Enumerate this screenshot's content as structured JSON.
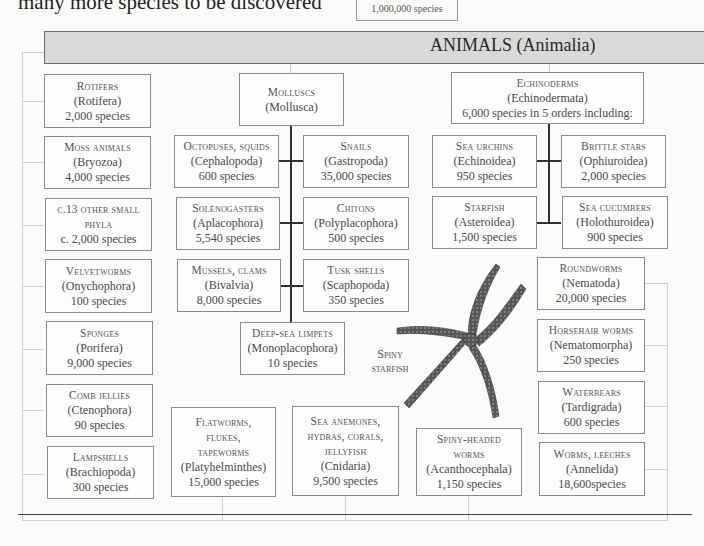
{
  "intro_text": "many more species to be discovered",
  "kingdom_summary": "1,000,000 species",
  "banner": {
    "title": "ANIMALS (Animalia)",
    "color": "#d9d9d7"
  },
  "left_column": [
    {
      "name": "Rotifers",
      "latin": "(Rotifera)",
      "count": "2,000 species"
    },
    {
      "name": "Moss animals",
      "latin": "(Bryozoa)",
      "count": "4,000 species"
    },
    {
      "name": "c.13 other small phyla",
      "latin": "",
      "count": "c. 2,000 species"
    },
    {
      "name": "Velvetworms",
      "latin": "(Onychophora)",
      "count": "100 species"
    },
    {
      "name": "Sponges",
      "latin": "(Porifera)",
      "count": "9,000 species"
    },
    {
      "name": "Comb jellies",
      "latin": "(Ctenophora)",
      "count": "90 species"
    },
    {
      "name": "Lampshells",
      "latin": "(Brachiopoda)",
      "count": "300 species"
    }
  ],
  "molluscs": {
    "parent": {
      "name": "Molluscs",
      "latin": "(Mollusca)"
    },
    "children": [
      {
        "name": "Octopuses, squids",
        "latin": "(Cephalopoda)",
        "count": "600 species"
      },
      {
        "name": "Snails",
        "latin": "(Gastropoda)",
        "count": "35,000 species"
      },
      {
        "name": "Solenogasters",
        "latin": "(Aplacophora)",
        "count": "5,540 species"
      },
      {
        "name": "Chitons",
        "latin": "(Polyplacophora)",
        "count": "500 species"
      },
      {
        "name": "Mussels, clams",
        "latin": "(Bivalvia)",
        "count": "8,000 species"
      },
      {
        "name": "Tusk shells",
        "latin": "(Scaphopoda)",
        "count": "350 species"
      },
      {
        "name": "Deep-sea limpets",
        "latin": "(Monoplacophora)",
        "count": "10 species"
      }
    ]
  },
  "echinoderms": {
    "parent": {
      "name": "Echinoderms",
      "latin": "(Echinodermata)",
      "count": "6,000 species in 5 orders including:"
    },
    "children": [
      {
        "name": "Sea urchins",
        "latin": "(Echinoidea)",
        "count": "950 species"
      },
      {
        "name": "Brittle stars",
        "latin": "(Ophiuroidea)",
        "count": "2,000 species"
      },
      {
        "name": "Starfish",
        "latin": "(Asteroidea)",
        "count": "1,500 species"
      },
      {
        "name": "Sea cucumbers",
        "latin": "(Holothuroidea)",
        "count": "900 species"
      }
    ]
  },
  "right_column": [
    {
      "name": "Roundworms",
      "latin": "(Nematoda)",
      "count": "20,000 species"
    },
    {
      "name": "Horsehair worms",
      "latin": "(Nematomorpha)",
      "count": "250 species"
    },
    {
      "name": "Waterbears",
      "latin": "(Tardigrada)",
      "count": "600 species"
    },
    {
      "name": "Worms, leeches",
      "latin": "(Annelida)",
      "count": "18,600species"
    }
  ],
  "bottom_row": [
    {
      "name": "Flatworms, flukes, tapeworms",
      "latin": "(Platyhelminthes)",
      "count": "15,000 species"
    },
    {
      "name": "Sea anemones, hydras, corals, jellyfish",
      "latin": "(Cnidaria)",
      "count": "9,500 species"
    },
    {
      "name": "Spiny-headed worms",
      "latin": "(Acanthocephala)",
      "count": "1,150 species"
    }
  ],
  "illustration": {
    "caption": "Spiny starfish",
    "icon": "starfish-illustration"
  }
}
